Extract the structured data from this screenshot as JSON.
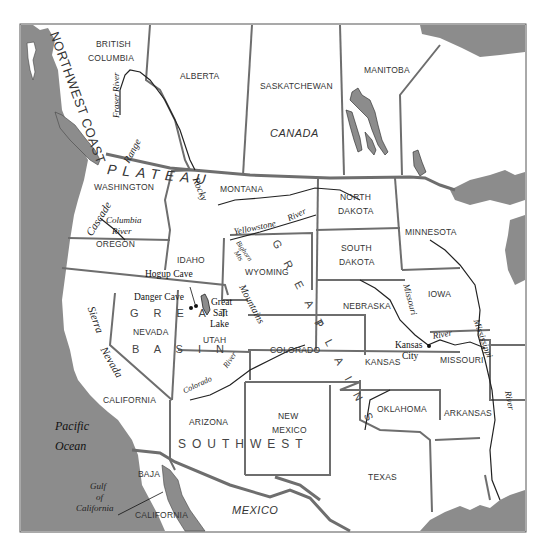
{
  "map": {
    "colors": {
      "water": "#8c8c8c",
      "land": "#ffffff",
      "border": "#6e6e6e",
      "river": "#222222"
    },
    "countries": [
      "CANADA",
      "MEXICO"
    ],
    "canadian_provinces": [
      "BRITISH",
      "COLUMBIA",
      "ALBERTA",
      "SASKATCHEWAN",
      "MANITOBA"
    ],
    "us_states": {
      "washington": "WASHINGTON",
      "oregon": "OREGON",
      "idaho": "IDAHO",
      "montana": "MONTANA",
      "wyoming": "WYOMING",
      "north_dakota_1": "NORTH",
      "north_dakota_2": "DAKOTA",
      "south_dakota_1": "SOUTH",
      "south_dakota_2": "DAKOTA",
      "minnesota": "MINNESOTA",
      "iowa": "IOWA",
      "nebraska": "NEBRASKA",
      "nevada": "NEVADA",
      "utah": "UTAH",
      "colorado": "COLORADO",
      "kansas": "KANSAS",
      "missouri": "MISSOURI",
      "california": "CALIFORNIA",
      "arizona": "ARIZONA",
      "new_mexico_1": "NEW",
      "new_mexico_2": "MEXICO",
      "oklahoma": "OKLAHOMA",
      "arkansas": "ARKANSAS",
      "texas": "TEXAS"
    },
    "mexican_states": {
      "baja": "BAJA",
      "california": "CALIFORNIA"
    },
    "culture_areas": {
      "northwest_coast": "NORTHWEST COAST",
      "plateau": "PLATEAU",
      "great_plains_1": "G R E A T",
      "great_plains_2": "P L A I N S",
      "great_basin_1": "G R E A T",
      "great_basin_2": "B A S I N",
      "southwest": "SOUTHWEST"
    },
    "physical": {
      "fraser_1": "Fraser",
      "fraser_2": "River",
      "coast_range": "Range",
      "cascade": "Cascade",
      "columbia_1": "Columbia",
      "columbia_2": "River",
      "rocky": "Rocky",
      "mountains": "Mountains",
      "yellowstone": "Yellowstone",
      "yellowstone_river": "River",
      "bighorn_1": "Bighorn",
      "bighorn_2": "Mts",
      "great_salt_lake_1": "Great",
      "great_salt_lake_2": "Salt",
      "great_salt_lake_3": "Lake",
      "sierra": "Sierra",
      "nevada": "Nevada",
      "colorado_river_1": "Colorado",
      "colorado_river_2": "River",
      "missouri_river_1": "Missouri",
      "missouri_river_2": "River",
      "mississippi_1": "Mississippi",
      "mississippi_2": "River"
    },
    "water_bodies": {
      "pacific_1": "Pacific",
      "pacific_2": "Ocean",
      "gulf_1": "Gulf",
      "gulf_2": "of",
      "gulf_3": "California"
    },
    "sites": {
      "hogup": "Hogup Cave",
      "danger": "Danger Cave",
      "kansas_city_1": "Kansas",
      "kansas_city_2": "City"
    }
  }
}
